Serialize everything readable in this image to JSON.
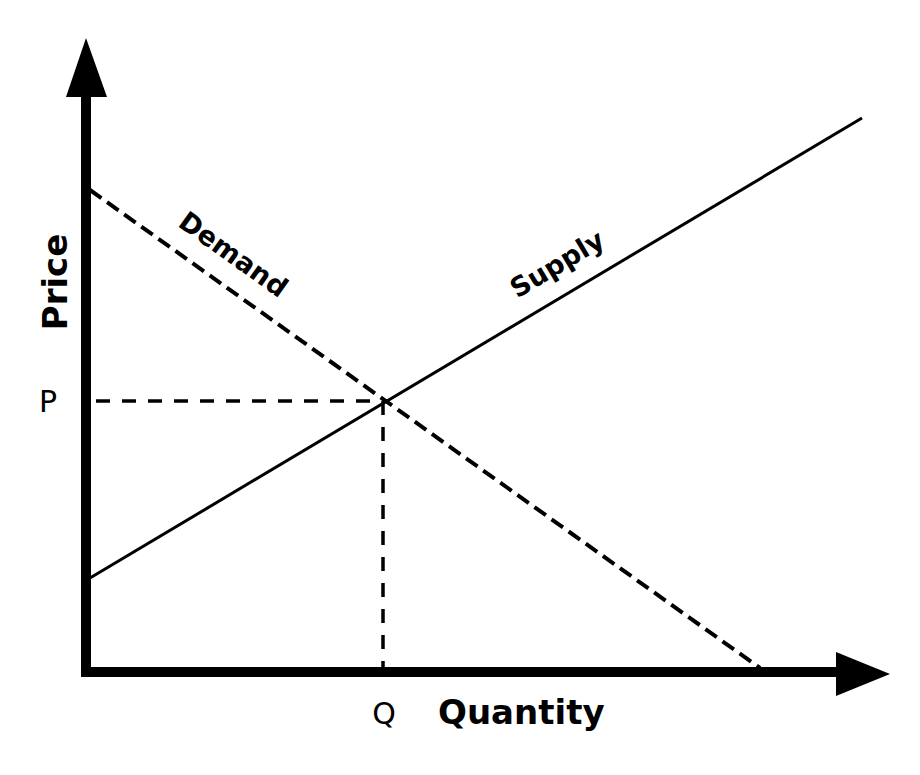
{
  "diagram": {
    "axes": {
      "y_label": "Price",
      "x_label": "Quantity"
    },
    "curves": [
      {
        "name": "Demand",
        "style": "dashed",
        "start": [
          90,
          190
        ],
        "end": [
          760,
          668
        ]
      },
      {
        "name": "Supply",
        "style": "solid",
        "start": [
          90,
          578
        ],
        "end": [
          862,
          118
        ]
      }
    ],
    "equilibrium": {
      "price_label": "P",
      "quantity_label": "Q",
      "point": [
        383,
        401
      ]
    },
    "colors": {
      "ink": "#000000",
      "background": "#ffffff"
    }
  }
}
